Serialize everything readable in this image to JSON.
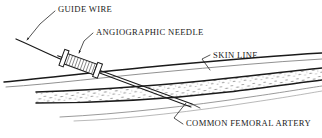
{
  "figure": {
    "type": "medical-illustration",
    "background_color": "#ffffff",
    "ink_color": "#1a1a1a",
    "width": 322,
    "height": 138
  },
  "labels": {
    "guide_wire": "GUIDE WIRE",
    "angiographic_needle": "ANGIOGRAPHIC NEEDLE",
    "skin_line": "SKIN LINE",
    "common_femoral_artery": "COMMON FEMORAL ARTERY"
  },
  "label_positions": {
    "guide_wire": {
      "x": 57,
      "y": 5
    },
    "angiographic_needle": {
      "x": 95,
      "y": 29
    },
    "skin_line": {
      "x": 212,
      "y": 53
    },
    "common_femoral_artery": {
      "x": 185,
      "y": 121
    }
  },
  "parts": [
    {
      "name": "guide-wire",
      "description": "curved wire entering needle hub from upper left"
    },
    {
      "name": "angiographic-needle",
      "description": "needle with hatched hub and shaft angled down-right"
    },
    {
      "name": "skin-line",
      "description": "upper tissue boundary line running left to right"
    },
    {
      "name": "common-femoral-artery",
      "description": "stippled vessel band beneath the skin line"
    }
  ],
  "leaders": [
    {
      "name": "guide-wire-leader",
      "arrow": true
    },
    {
      "name": "angiographic-needle-leader",
      "arrow": true
    },
    {
      "name": "skin-line-leader",
      "arrow": false
    },
    {
      "name": "common-femoral-artery-leader",
      "arrow": false
    }
  ]
}
